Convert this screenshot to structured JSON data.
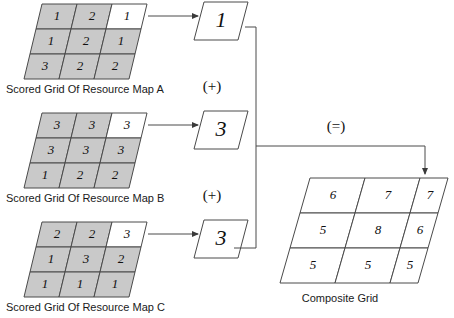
{
  "diagram": {
    "colors": {
      "cell_fill_scored": "#c9c9c9",
      "cell_fill_highlight": "#ffffff",
      "stroke": "#4a4a4a",
      "background": "#ffffff",
      "text": "#101010"
    }
  },
  "source_grids": [
    {
      "id": "map-a",
      "caption": "Scored Grid Of Resource Map A",
      "rows": [
        [
          {
            "value": "1",
            "highlight": false
          },
          {
            "value": "2",
            "highlight": false
          },
          {
            "value": "1",
            "highlight": true
          }
        ],
        [
          {
            "value": "1",
            "highlight": false
          },
          {
            "value": "2",
            "highlight": false
          },
          {
            "value": "1",
            "highlight": false
          }
        ],
        [
          {
            "value": "3",
            "highlight": false
          },
          {
            "value": "2",
            "highlight": false
          },
          {
            "value": "2",
            "highlight": false
          }
        ]
      ]
    },
    {
      "id": "map-b",
      "caption": "Scored Grid Of Resource Map B",
      "rows": [
        [
          {
            "value": "3",
            "highlight": false
          },
          {
            "value": "3",
            "highlight": false
          },
          {
            "value": "3",
            "highlight": true
          }
        ],
        [
          {
            "value": "3",
            "highlight": false
          },
          {
            "value": "3",
            "highlight": false
          },
          {
            "value": "3",
            "highlight": false
          }
        ],
        [
          {
            "value": "1",
            "highlight": false
          },
          {
            "value": "2",
            "highlight": false
          },
          {
            "value": "2",
            "highlight": false
          }
        ]
      ]
    },
    {
      "id": "map-c",
      "caption": "Scored Grid Of Resource Map C",
      "rows": [
        [
          {
            "value": "2",
            "highlight": false
          },
          {
            "value": "2",
            "highlight": false
          },
          {
            "value": "3",
            "highlight": true
          }
        ],
        [
          {
            "value": "1",
            "highlight": false
          },
          {
            "value": "3",
            "highlight": false
          },
          {
            "value": "2",
            "highlight": false
          }
        ],
        [
          {
            "value": "1",
            "highlight": false
          },
          {
            "value": "1",
            "highlight": false
          },
          {
            "value": "1",
            "highlight": false
          }
        ]
      ]
    }
  ],
  "extracted_values": [
    {
      "id": "value-a",
      "value": "1",
      "operator_below": "(+)"
    },
    {
      "id": "value-b",
      "value": "3",
      "operator_below": "(+)"
    },
    {
      "id": "value-c",
      "value": "3",
      "operator_below": ""
    }
  ],
  "equals_label": "(=)",
  "composite_grid": {
    "id": "composite",
    "caption": "Composite Grid",
    "rows": [
      [
        {
          "value": "6",
          "highlight": true
        },
        {
          "value": "7",
          "highlight": true
        },
        {
          "value": "7",
          "highlight": true
        }
      ],
      [
        {
          "value": "5",
          "highlight": true
        },
        {
          "value": "8",
          "highlight": true
        },
        {
          "value": "6",
          "highlight": true
        }
      ],
      [
        {
          "value": "5",
          "highlight": true
        },
        {
          "value": "5",
          "highlight": true
        },
        {
          "value": "5",
          "highlight": true
        }
      ]
    ]
  }
}
